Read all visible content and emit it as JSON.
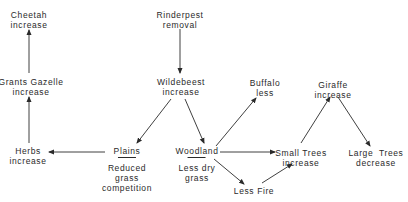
{
  "diagram": {
    "nodes": {
      "cheetah": {
        "line1": "Cheetah",
        "line2": "increase"
      },
      "gazelle": {
        "line1": "Grants Gazelle",
        "line2": "increase"
      },
      "herbs": {
        "line1": "Herbs",
        "line2": "increase"
      },
      "rinderpest": {
        "line1": "Rinderpest",
        "line2": "removal"
      },
      "wildebeest": {
        "line1": "Wildebeest",
        "line2": "increase"
      },
      "plains": {
        "label": "Plains",
        "note1": "Reduced",
        "note2": "grass",
        "note3": "competition"
      },
      "woodland": {
        "label": "Woodland",
        "note1": "Less dry",
        "note2": "grass"
      },
      "buffalo": {
        "line1": "Buffalo",
        "line2": "less"
      },
      "giraffe": {
        "line1": "Giraffe",
        "line2": "increase"
      },
      "small_trees": {
        "line1": "Small Trees",
        "line2": "increase"
      },
      "large_trees": {
        "line1": "Large  Trees",
        "line2": "decrease"
      },
      "less_fire": {
        "label": "Less Fire"
      }
    },
    "edges": [
      {
        "from": "rinderpest",
        "to": "wildebeest"
      },
      {
        "from": "wildebeest",
        "to": "plains"
      },
      {
        "from": "wildebeest",
        "to": "woodland"
      },
      {
        "from": "plains",
        "to": "herbs"
      },
      {
        "from": "herbs",
        "to": "gazelle"
      },
      {
        "from": "gazelle",
        "to": "cheetah"
      },
      {
        "from": "woodland",
        "to": "buffalo"
      },
      {
        "from": "woodland",
        "to": "small_trees"
      },
      {
        "from": "woodland",
        "to": "less_fire"
      },
      {
        "from": "less_fire",
        "to": "small_trees"
      },
      {
        "from": "small_trees",
        "to": "giraffe"
      },
      {
        "from": "giraffe",
        "to": "large_trees"
      }
    ],
    "line_color": "#2a2a2a"
  }
}
